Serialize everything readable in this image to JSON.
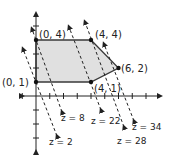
{
  "diagram": {
    "objective": "z = 5x + 2y",
    "colors": {
      "region_fill": "#e0e0e0",
      "region_stroke": "#3a3a3a",
      "axis": "#222222",
      "dashed_line": "#222222",
      "vertex": "#111111"
    },
    "vertices": [
      {
        "x": 0,
        "y": 4,
        "label": "(0, 4)"
      },
      {
        "x": 4,
        "y": 4,
        "label": "(4, 4)"
      },
      {
        "x": 6,
        "y": 2,
        "label": "(6, 2)"
      },
      {
        "x": 4,
        "y": 1,
        "label": "(4, 1)"
      },
      {
        "x": 0,
        "y": 1,
        "label": "(0, 1)"
      }
    ],
    "level_lines": [
      {
        "z": 2,
        "label": "z = 2"
      },
      {
        "z": 8,
        "label": "z = 8"
      },
      {
        "z": 22,
        "label": "z = 22"
      },
      {
        "z": 28,
        "label": "z = 28"
      },
      {
        "z": 34,
        "label": "z = 34"
      }
    ],
    "axes": {
      "x_ticks": [
        -1,
        1,
        2,
        3,
        4,
        5,
        6,
        7,
        8
      ],
      "y_ticks": [
        -4,
        -3,
        -2,
        -1,
        1,
        2,
        3,
        4,
        5
      ]
    }
  }
}
